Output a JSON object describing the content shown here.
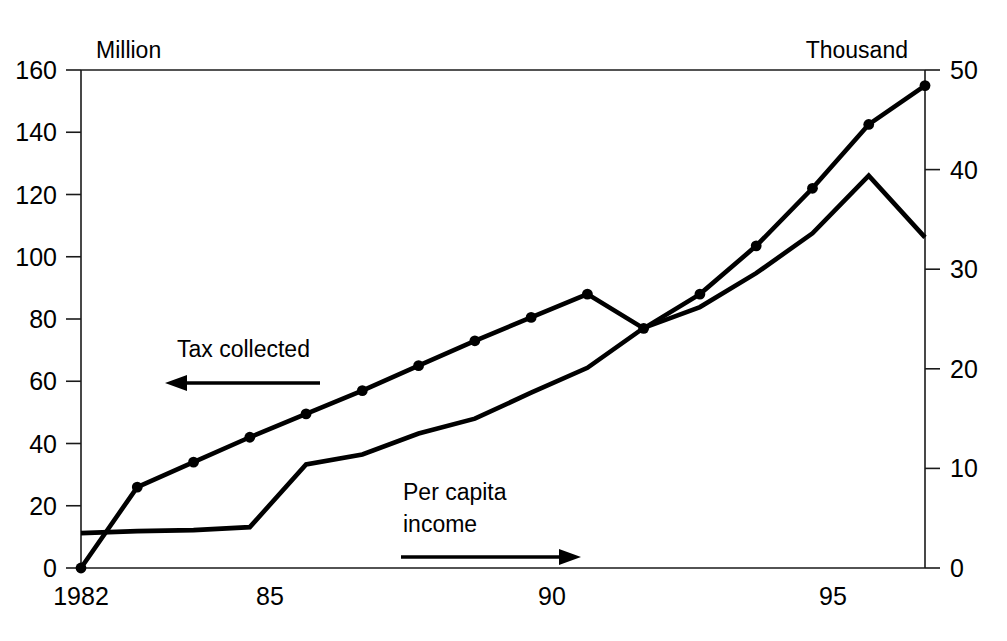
{
  "chart_data": {
    "type": "line",
    "title": "",
    "subtitle": "",
    "xlabel": "",
    "ylabel": "Million",
    "y2label": "Thousand",
    "grid": false,
    "legend_position": "inline-annotations",
    "x": [
      1982,
      1983,
      1984,
      1985,
      1986,
      1987,
      1988,
      1989,
      1990,
      1991,
      1992,
      1993,
      1994,
      1995,
      1996,
      1997
    ],
    "xlim": [
      1982,
      1997
    ],
    "x_tick_values": [
      1982,
      1985,
      1990,
      1995
    ],
    "x_tick_labels": [
      "1982",
      "85",
      "90",
      "95"
    ],
    "ylim": [
      0,
      160
    ],
    "y_tick_values": [
      0,
      20,
      40,
      60,
      80,
      100,
      120,
      140,
      160
    ],
    "y_tick_labels": [
      "0",
      "20",
      "40",
      "60",
      "80",
      "100",
      "120",
      "140",
      "160"
    ],
    "y2lim": [
      0,
      50
    ],
    "y2_tick_values": [
      0,
      10,
      20,
      30,
      40,
      50
    ],
    "y2_tick_labels": [
      "0",
      "10",
      "20",
      "30",
      "40",
      "50"
    ],
    "series": [
      {
        "name": "Tax collected",
        "axis": "left",
        "unit": "Million",
        "markers": true,
        "values": [
          0,
          26,
          34,
          42,
          49.5,
          57,
          65,
          73,
          80.5,
          88,
          77,
          88,
          103.5,
          122,
          142.5,
          155
        ]
      },
      {
        "name": "Per capita income",
        "axis": "right",
        "unit": "Thousand",
        "markers": false,
        "values": [
          3.5,
          3.7,
          3.8,
          4.1,
          10.4,
          11.4,
          13.5,
          15.0,
          17.6,
          20.1,
          24.1,
          26.2,
          29.6,
          33.6,
          39.4,
          33.2
        ]
      }
    ],
    "annotations": [
      {
        "name": "tax-collected-annotation",
        "text": "Tax collected",
        "arrow_direction": "left",
        "points_to_axis": "left"
      },
      {
        "name": "per-capita-income-annotation",
        "text_line_1": "Per capita",
        "text_line_2": "income",
        "arrow_direction": "right",
        "points_to_axis": "right"
      }
    ],
    "colors": {
      "line": "#000000",
      "axis": "#1a1a1a",
      "background": "#ffffff"
    }
  },
  "labels": {
    "left_axis_unit": "Million",
    "right_axis_unit": "Thousand"
  }
}
